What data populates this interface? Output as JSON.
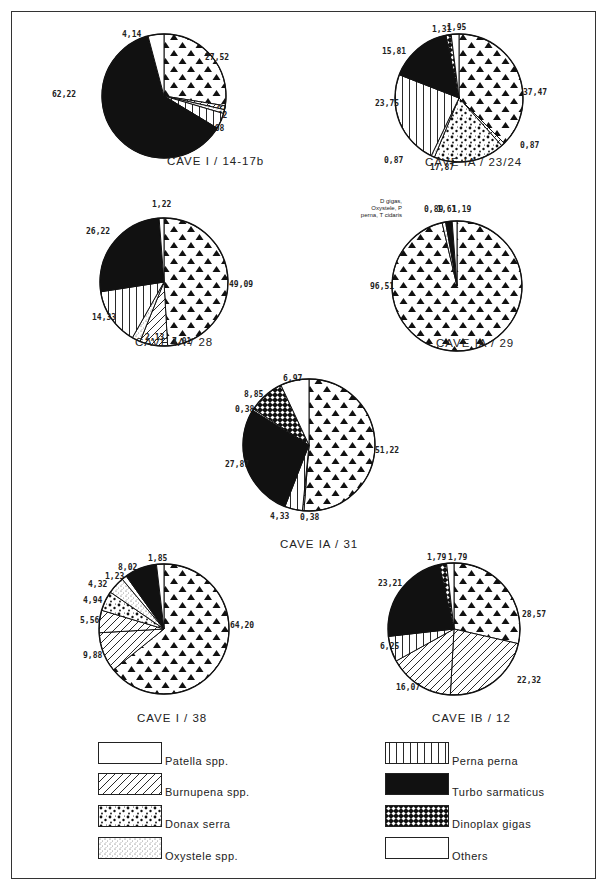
{
  "legend": {
    "left": [
      {
        "key": "patella",
        "label": "Patella spp."
      },
      {
        "key": "burnupena",
        "label": "Burnupena spp."
      },
      {
        "key": "donax",
        "label": "Donax serra"
      },
      {
        "key": "oxystele",
        "label": "Oxystele spp."
      }
    ],
    "right": [
      {
        "key": "perna",
        "label": "Perna perna"
      },
      {
        "key": "turbo",
        "label": "Turbo sarmaticus"
      },
      {
        "key": "dinoplax",
        "label": "Dinoplax gigas"
      },
      {
        "key": "others",
        "label": "Others"
      }
    ]
  },
  "chart_data": [
    {
      "type": "pie",
      "title": "CAVE I / 14-17b",
      "slices": [
        {
          "category": "triangles",
          "value": 27.52,
          "label": "27,52"
        },
        {
          "category": "burnupena",
          "value": 1.02,
          "label": "1,02"
        },
        {
          "category": "oxystele",
          "value": 1.02,
          "label": "1,02"
        },
        {
          "category": "perna",
          "value": 4.08,
          "label": "4,08"
        },
        {
          "category": "turbo",
          "value": 62.22,
          "label": "62,22"
        },
        {
          "category": "patella",
          "value": 4.14,
          "label": "4,14"
        }
      ]
    },
    {
      "type": "pie",
      "title": "CAVE IA / 23/24",
      "slices": [
        {
          "category": "triangles",
          "value": 37.47,
          "label": "37,47"
        },
        {
          "category": "burnupena",
          "value": 0.87,
          "label": "0,87"
        },
        {
          "category": "donax",
          "value": 17.87,
          "label": "17,87"
        },
        {
          "category": "oxystele",
          "value": 0.87,
          "label": "0,87"
        },
        {
          "category": "perna",
          "value": 23.75,
          "label": "23,75"
        },
        {
          "category": "turbo",
          "value": 15.81,
          "label": "15,81"
        },
        {
          "category": "dinoplax",
          "value": 1.31,
          "label": "1,31"
        },
        {
          "category": "patella",
          "value": 1.95,
          "label": "1,95"
        }
      ]
    },
    {
      "type": "pie",
      "title": "CAVE IA / 28",
      "slices": [
        {
          "category": "triangles",
          "value": 49.09,
          "label": "49,09"
        },
        {
          "category": "burnupena",
          "value": 7.01,
          "label": "7,01"
        },
        {
          "category": "oxystele",
          "value": 2.13,
          "label": "2,13"
        },
        {
          "category": "perna",
          "value": 14.33,
          "label": "14,33"
        },
        {
          "category": "turbo",
          "value": 26.22,
          "label": "26,22"
        },
        {
          "category": "patella",
          "value": 1.22,
          "label": "1,22"
        }
      ]
    },
    {
      "type": "pie",
      "title": "CAVE IA / 29",
      "note": "D gigas, Oxystele, P perna, T cidaris",
      "slices": [
        {
          "category": "triangles",
          "value": 96.51,
          "label": "96,51"
        },
        {
          "category": "oxystele",
          "value": 0.89,
          "label": "0,89"
        },
        {
          "category": "turbo",
          "value": 1.61,
          "label": "1,61"
        },
        {
          "category": "patella",
          "value": 1.19,
          "label": "1,19"
        }
      ]
    },
    {
      "type": "pie",
      "title": "CAVE IA / 31",
      "slices": [
        {
          "category": "triangles",
          "value": 51.22,
          "label": "51,22"
        },
        {
          "category": "burnupena",
          "value": 0.38,
          "label": "0,38"
        },
        {
          "category": "perna",
          "value": 4.33,
          "label": "4,33"
        },
        {
          "category": "turbo",
          "value": 27.87,
          "label": "27,87"
        },
        {
          "category": "others",
          "value": 0.38,
          "label": "0,38"
        },
        {
          "category": "dinoplax",
          "value": 8.85,
          "label": "8,85"
        },
        {
          "category": "patella",
          "value": 6.97,
          "label": "6,97"
        }
      ]
    },
    {
      "type": "pie",
      "title": "CAVE I / 38",
      "slices": [
        {
          "category": "triangles",
          "value": 64.2,
          "label": "64,20"
        },
        {
          "category": "burnupena",
          "value": 9.88,
          "label": "9,88"
        },
        {
          "category": "burnupena",
          "value": 5.56,
          "label": "5,56"
        },
        {
          "category": "donax",
          "value": 4.94,
          "label": "4,94"
        },
        {
          "category": "oxystele",
          "value": 4.32,
          "label": "4,32"
        },
        {
          "category": "others",
          "value": 1.23,
          "label": "1,23"
        },
        {
          "category": "turbo",
          "value": 8.02,
          "label": "8,02"
        },
        {
          "category": "patella",
          "value": 1.85,
          "label": "1,85"
        }
      ]
    },
    {
      "type": "pie",
      "title": "CAVE IB / 12",
      "slices": [
        {
          "category": "triangles",
          "value": 28.57,
          "label": "28,57"
        },
        {
          "category": "burnupena",
          "value": 22.32,
          "label": "22,32"
        },
        {
          "category": "burnupena",
          "value": 16.07,
          "label": "16,07"
        },
        {
          "category": "perna",
          "value": 6.25,
          "label": "6,25"
        },
        {
          "category": "turbo",
          "value": 23.21,
          "label": "23,21"
        },
        {
          "category": "dinoplax",
          "value": 1.79,
          "label": "1,79"
        },
        {
          "category": "patella",
          "value": 1.79,
          "label": "1,79"
        }
      ]
    }
  ]
}
